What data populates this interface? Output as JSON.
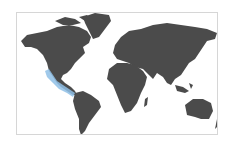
{
  "map": {
    "type": "world-distribution-map",
    "land_color": "#4b4b4b",
    "ocean_color": "#ffffff",
    "frame_color": "#d6d6d6",
    "highlight": {
      "label": "species range",
      "color": "#8fbfe6",
      "region": "Pacific coast of Mexico and Central America"
    }
  }
}
